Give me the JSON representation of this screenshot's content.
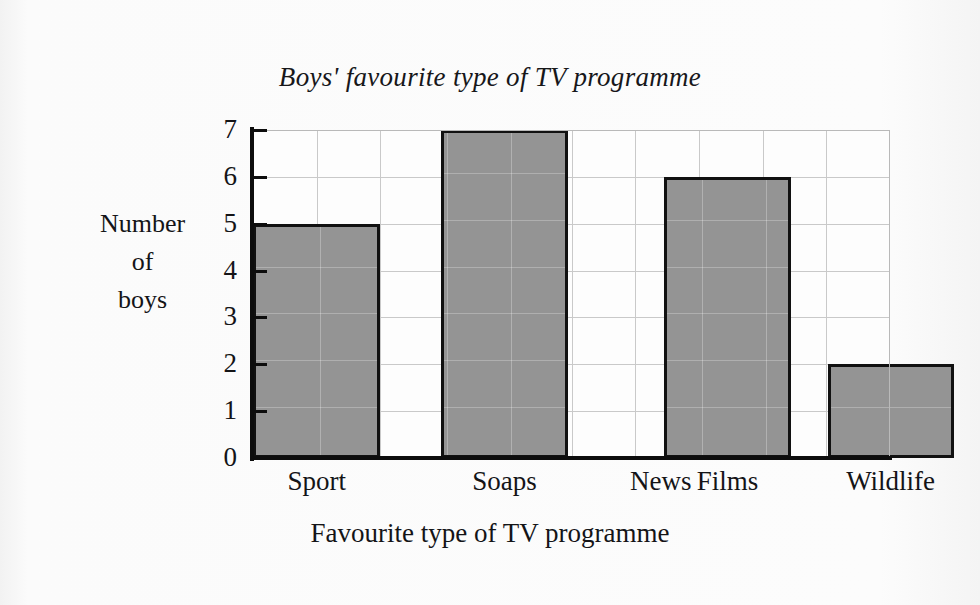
{
  "chart_data": {
    "type": "bar",
    "title": "Boys' favourite type of TV programme",
    "xlabel": "Favourite type of TV programme",
    "ylabel": "Number of boys",
    "ylabel_lines": [
      "Number",
      "of",
      "boys"
    ],
    "categories": [
      "Sport",
      "Soaps",
      "News",
      "Films",
      "Wildlife"
    ],
    "values": [
      5,
      7,
      0,
      6,
      2
    ],
    "ylim": [
      0,
      7
    ],
    "ytick_labels": [
      "0",
      "1",
      "2",
      "3",
      "4",
      "5",
      "6",
      "7"
    ],
    "ytick_values": [
      0,
      1,
      2,
      3,
      4,
      5,
      6,
      7
    ],
    "grid": true,
    "grid_columns": 10,
    "legend": null,
    "bar_fill_color": "#949494",
    "bar_edge_color": "#111111",
    "grid_color": "#c9c9c9",
    "axis_color": "#0d0d0d",
    "background_color": "#fbfbfb",
    "text_color": "#141417"
  }
}
